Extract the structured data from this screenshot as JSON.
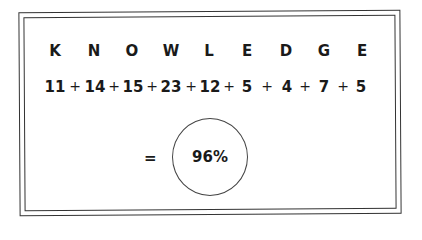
{
  "word": {
    "letters": [
      "K",
      "N",
      "O",
      "W",
      "L",
      "E",
      "D",
      "G",
      "E"
    ],
    "values": [
      "11",
      "14",
      "15",
      "23",
      "12",
      "5",
      "4",
      "7",
      "5"
    ],
    "operator": "+"
  },
  "result": {
    "equals": "=",
    "value": "96%"
  }
}
